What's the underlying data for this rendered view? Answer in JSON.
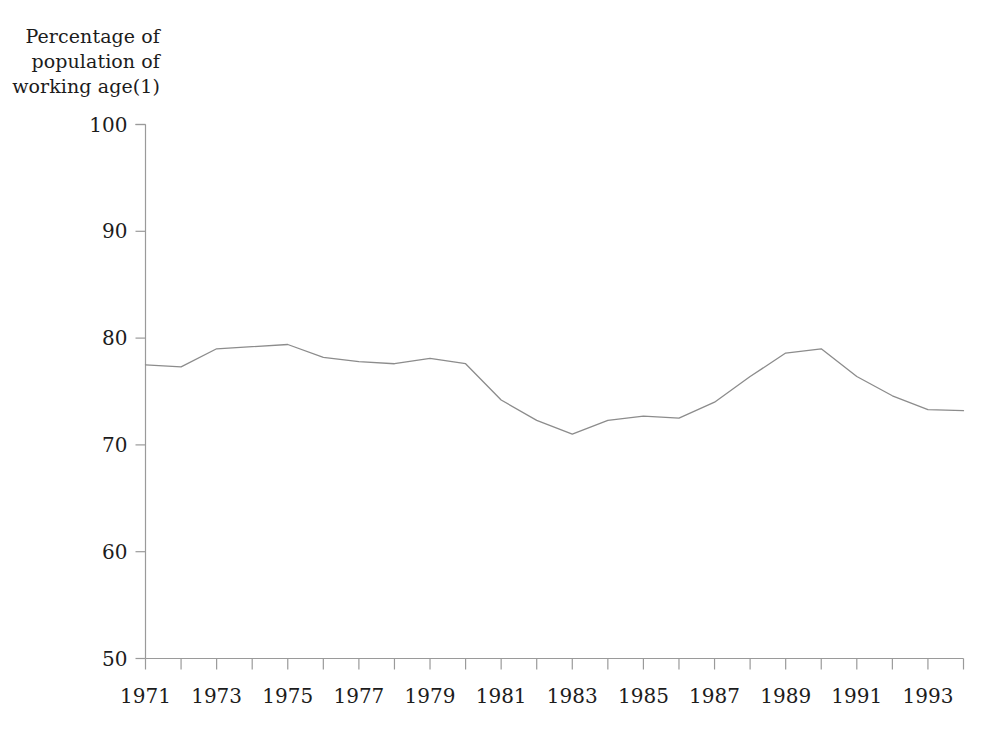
{
  "chart_data": {
    "type": "line",
    "title": "",
    "subtitle": "",
    "ylabel": "Percentage of\npopulation of\nworking age(1)",
    "xlabel": "",
    "ylim": [
      50,
      100
    ],
    "yticks": [
      50,
      60,
      70,
      80,
      90,
      100
    ],
    "ytick_labels": [
      "50",
      "60",
      "70",
      "80",
      "90",
      "100"
    ],
    "xlim": [
      1971,
      1994
    ],
    "xticks": [
      1971,
      1972,
      1973,
      1974,
      1975,
      1976,
      1977,
      1978,
      1979,
      1980,
      1981,
      1982,
      1983,
      1984,
      1985,
      1986,
      1987,
      1988,
      1989,
      1990,
      1991,
      1992,
      1993,
      1994
    ],
    "xtick_labels": [
      "1971",
      "",
      "1973",
      "",
      "1975",
      "",
      "1977",
      "",
      "1979",
      "",
      "1981",
      "",
      "1983",
      "",
      "1985",
      "",
      "1987",
      "",
      "1989",
      "",
      "1991",
      "",
      "1993",
      ""
    ],
    "grid": false,
    "legend": false,
    "legend_position": "none",
    "line_color": "#8c8c8c",
    "axis_color": "#9a9a9a",
    "x": [
      1971,
      1972,
      1973,
      1974,
      1975,
      1976,
      1977,
      1978,
      1979,
      1980,
      1981,
      1982,
      1983,
      1984,
      1985,
      1986,
      1987,
      1988,
      1989,
      1990,
      1991,
      1992,
      1993,
      1994
    ],
    "values": [
      77.5,
      77.3,
      79.0,
      79.2,
      79.4,
      78.2,
      77.8,
      77.6,
      78.1,
      77.6,
      74.2,
      72.3,
      71.0,
      72.3,
      72.7,
      72.5,
      74.0,
      76.4,
      78.6,
      79.0,
      76.4,
      74.6,
      73.3,
      73.2
    ],
    "series": [
      {
        "name": "Percentage of population of working age",
        "values": [
          77.5,
          77.3,
          79.0,
          79.2,
          79.4,
          78.2,
          77.8,
          77.6,
          78.1,
          77.6,
          74.2,
          72.3,
          71.0,
          72.3,
          72.7,
          72.5,
          74.0,
          76.4,
          78.6,
          79.0,
          76.4,
          74.6,
          73.3,
          73.2
        ]
      }
    ],
    "annotations": []
  }
}
